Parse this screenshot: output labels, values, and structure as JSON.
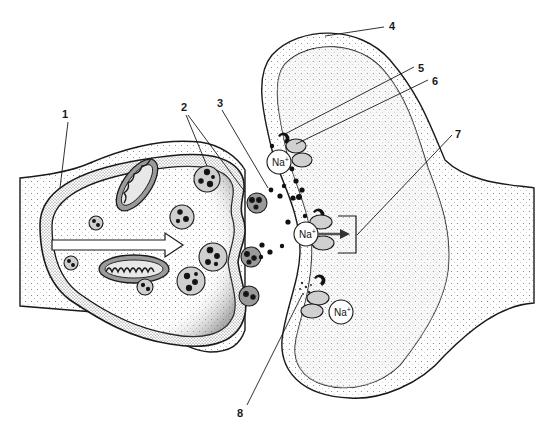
{
  "diagram": {
    "labels": [
      {
        "id": "1",
        "text": "1",
        "x": 62,
        "y": 108
      },
      {
        "id": "2",
        "text": "2",
        "x": 181,
        "y": 101
      },
      {
        "id": "3",
        "text": "3",
        "x": 217,
        "y": 97
      },
      {
        "id": "4",
        "text": "4",
        "x": 389,
        "y": 20
      },
      {
        "id": "5",
        "text": "5",
        "x": 418,
        "y": 62
      },
      {
        "id": "6",
        "text": "6",
        "x": 432,
        "y": 75
      },
      {
        "id": "7",
        "text": "7",
        "x": 455,
        "y": 128
      },
      {
        "id": "8",
        "text": "8",
        "x": 237,
        "y": 407
      }
    ],
    "ions": [
      {
        "text": "Na",
        "sup": "+",
        "x": 279,
        "y": 162
      },
      {
        "text": "Na",
        "sup": "+",
        "x": 306,
        "y": 234
      },
      {
        "text": "Na",
        "sup": "+",
        "x": 341,
        "y": 312
      }
    ],
    "colors": {
      "line": "#1a1a1a",
      "stipple_light": "#d9d9d9",
      "stipple_dark": "#8a8a8a",
      "background": "#ffffff"
    }
  }
}
